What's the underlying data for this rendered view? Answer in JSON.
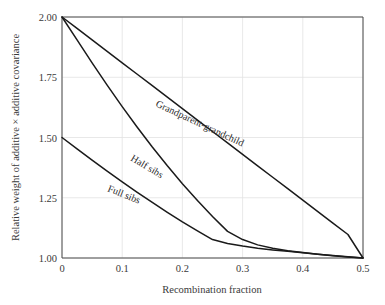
{
  "chart_data": {
    "type": "line",
    "title": "",
    "xlabel": "Recombination fraction",
    "ylabel": "Relative weight of additive × additive covariance",
    "xlim": [
      0,
      0.5
    ],
    "ylim": [
      1.0,
      2.0
    ],
    "grid": true,
    "legend_position": "inline-curve-labels",
    "xticks": [
      0,
      0.1,
      0.2,
      0.3,
      0.4,
      0.5
    ],
    "xtick_labels": [
      "0",
      "0.1",
      "0.2",
      "0.3",
      "0.4",
      "0.5"
    ],
    "yticks": [
      1.0,
      1.25,
      1.5,
      1.75,
      2.0
    ],
    "ytick_labels": [
      "1.00",
      "1.25",
      "1.50",
      "1.75",
      "2.00"
    ],
    "x": [
      0,
      0.025,
      0.05,
      0.075,
      0.1,
      0.125,
      0.15,
      0.175,
      0.2,
      0.225,
      0.25,
      0.275,
      0.3,
      0.325,
      0.35,
      0.375,
      0.4,
      0.425,
      0.45,
      0.475,
      0.5
    ],
    "series": [
      {
        "name": "Grandparent-grandchild",
        "label": "Grandparent-grandchild",
        "color": "#1a1a1a",
        "values": [
          2.0,
          1.9525,
          1.905,
          1.8575,
          1.81,
          1.7625,
          1.715,
          1.6675,
          1.62,
          1.5725,
          1.525,
          1.4775,
          1.43,
          1.3825,
          1.335,
          1.2875,
          1.24,
          1.1925,
          1.145,
          1.0975,
          1.0
        ]
      },
      {
        "name": "Half sibs",
        "label": "Half sibs",
        "color": "#1a1a1a",
        "values": [
          2.0,
          1.905,
          1.81,
          1.7175,
          1.628,
          1.5425,
          1.4605,
          1.3825,
          1.3085,
          1.2385,
          1.1725,
          1.1105,
          1.0765,
          1.0545,
          1.0405,
          1.0305,
          1.0225,
          1.0155,
          1.0095,
          1.0045,
          1.0
        ]
      },
      {
        "name": "Full sibs",
        "label": "Full sibs",
        "color": "#1a1a1a",
        "values": [
          1.5,
          1.4525,
          1.406,
          1.3605,
          1.316,
          1.2725,
          1.2305,
          1.1895,
          1.15,
          1.1125,
          1.0765,
          1.0605,
          1.0495,
          1.0405,
          1.0335,
          1.0275,
          1.0215,
          1.0155,
          1.0105,
          1.005,
          1.0
        ]
      }
    ]
  }
}
